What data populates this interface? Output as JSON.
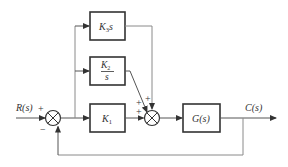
{
  "diagram": {
    "type": "control-system-block-diagram",
    "input": {
      "label": "R(s)"
    },
    "output": {
      "label": "C(s)"
    },
    "summing_junctions": [
      {
        "id": "error-summer",
        "inputs": [
          {
            "from": "R(s)",
            "sign": "+"
          },
          {
            "from": "feedback",
            "sign": "−"
          }
        ]
      },
      {
        "id": "controller-summer",
        "inputs": [
          {
            "from": "K3s",
            "sign": "+"
          },
          {
            "from": "K2/s",
            "sign": "+"
          },
          {
            "from": "K1",
            "sign": "+"
          }
        ]
      }
    ],
    "blocks": [
      {
        "id": "derivative",
        "label_main": "K",
        "label_sub": "3",
        "label_suffix": "s"
      },
      {
        "id": "integral",
        "num_main": "K",
        "num_sub": "2",
        "den": "s"
      },
      {
        "id": "proportional",
        "label_main": "K",
        "label_sub": "1"
      },
      {
        "id": "plant",
        "label": "G(s)"
      }
    ],
    "signs": {
      "plus": "+",
      "minus": "−"
    }
  }
}
